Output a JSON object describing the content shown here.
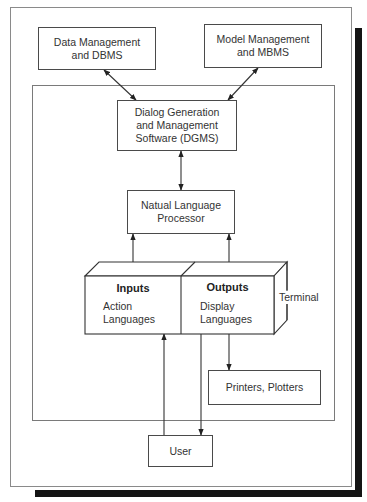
{
  "diagram": {
    "top_boxes": {
      "data_management": [
        "Data Management",
        "and DBMS"
      ],
      "model_management": [
        "Model Management",
        "and MBMS"
      ]
    },
    "dgms": [
      "Dialog Generation",
      "and Management",
      "Software (DGMS)"
    ],
    "nlp": [
      "Natual Language",
      "Processor"
    ],
    "terminal": {
      "label": "Terminal",
      "inputs": {
        "title": "Inputs",
        "lines": [
          "Action",
          "Languages"
        ]
      },
      "outputs": {
        "title": "Outputs",
        "lines": [
          "Display",
          "Languages"
        ]
      }
    },
    "printers": "Printers, Plotters",
    "user": "User",
    "colors": {
      "line": "#333333",
      "shadow": "#141414",
      "frame": "#8a8a8a"
    }
  }
}
